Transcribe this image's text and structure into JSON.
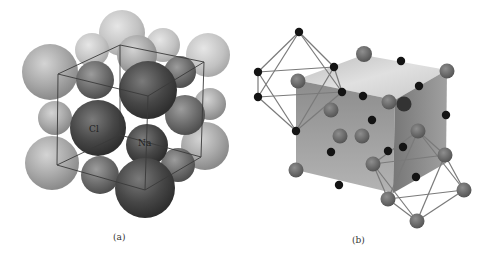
{
  "figure": {
    "panels": [
      {
        "id": "a",
        "caption": "(a)",
        "description": "Space-filling model of NaCl unit cell",
        "labels": {
          "cl": "Cl",
          "na": "Na"
        }
      },
      {
        "id": "b",
        "caption": "(b)",
        "description": "Ball-and-stick model showing octahedral coordination"
      }
    ]
  }
}
